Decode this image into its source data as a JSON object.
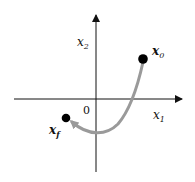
{
  "diagram": {
    "type": "phase-plane trajectory",
    "axes": {
      "horizontal_label": "x",
      "horizontal_subscript": "1",
      "vertical_label": "x",
      "vertical_subscript": "2",
      "origin_label": "0"
    },
    "points": {
      "start": {
        "label": "x",
        "subscript": "0"
      },
      "end": {
        "label": "x",
        "subscript": "f"
      }
    },
    "colors": {
      "axis": "#111111",
      "trajectory": "#9a9a9a",
      "point": "#000000"
    }
  }
}
